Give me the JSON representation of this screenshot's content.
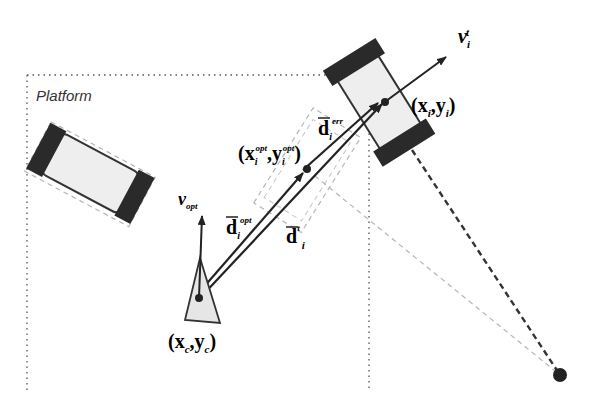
{
  "diagram": {
    "region_label": "Platform",
    "labels": {
      "v_target": {
        "base": "v",
        "sub": "i",
        "sup": "t"
      },
      "target_pos": {
        "open": "(",
        "x": "x",
        "x_sub": "i",
        "comma": ",",
        "y": "y",
        "y_sub": "i",
        "close": ")"
      },
      "d_err": {
        "base": "d",
        "sub": "i",
        "sup": "err"
      },
      "opt_pos": {
        "open": "(",
        "x": "x",
        "x_sub": "i",
        "x_sup": "opt",
        "comma": ",",
        "y": "y",
        "y_sub": "i",
        "y_sup": "opt",
        "close": ")"
      },
      "v_opt": {
        "base": "v",
        "sub": "opt"
      },
      "d_opt": {
        "base": "d",
        "sub": "i",
        "sup": "opt"
      },
      "d_t": {
        "base": "d",
        "sub": "i",
        "sup": "t"
      },
      "camera_pos": {
        "open": "(",
        "x": "x",
        "x_sub": "c",
        "comma": ",",
        "y": "y",
        "y_sub": "c",
        "close": ")"
      }
    },
    "colors": {
      "stroke": "#222222",
      "vehicle_body": "#eeeeee",
      "wheel": "#2a2a2a",
      "camera_fill": "#e6e6e6",
      "ghost": "#b5b5b5",
      "border_dots": "#555555"
    }
  }
}
